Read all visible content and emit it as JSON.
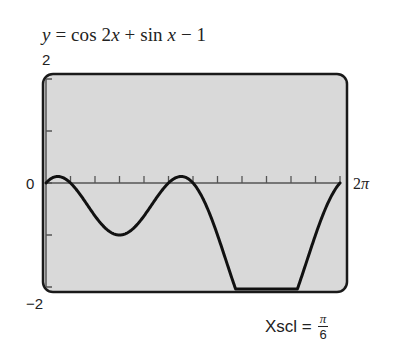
{
  "chart_data": {
    "type": "line",
    "title": "y = cos 2x + sin x − 1",
    "function": "cos(2x) + sin(x) - 1",
    "xlabel": "",
    "ylabel": "",
    "xlim": [
      0,
      6.2832
    ],
    "ylim": [
      -2,
      2
    ],
    "x_tick_step": 0.5236,
    "y_tick_step": 1,
    "x_tick_count": 12,
    "xmin_label": "0",
    "xmax_label": "2π",
    "ymax_label": "2",
    "ymin_label": "−2",
    "annotation": "Xscl = π/6",
    "grid": false,
    "legend": null,
    "series": [
      {
        "name": "y = cos 2x + sin x − 1",
        "x": [
          0,
          0.2618,
          0.5236,
          0.7854,
          1.0472,
          1.309,
          1.5708,
          1.8326,
          2.0944,
          2.3562,
          2.618,
          2.8798,
          3.1416,
          3.4034,
          3.6652,
          3.927,
          4.1888,
          4.4506,
          4.7124,
          4.9742,
          5.236,
          5.4978,
          5.7596,
          6.0214,
          6.2832
        ],
        "values": [
          0,
          0.125,
          0,
          -0.293,
          -0.634,
          -0.9,
          -1,
          -0.9,
          -0.634,
          -0.293,
          0,
          0.125,
          0,
          -0.393,
          -1.0,
          -1.707,
          -2.366,
          -2.832,
          -3,
          -2.832,
          -2.366,
          -1.707,
          -1.0,
          -0.393,
          0
        ]
      }
    ]
  },
  "equation": {
    "lhs": "y",
    "eq": " = cos 2",
    "x1": "x",
    "mid": " + sin ",
    "x2": "x",
    "rhs": " − 1"
  },
  "axes": {
    "ymax": "2",
    "ymin": "−2",
    "zero": "0",
    "xmax_num": "2",
    "xmax_pi": "π"
  },
  "xscl": {
    "label": "Xscl =",
    "numerator": "π",
    "denominator": "6"
  },
  "colors": {
    "screen_fill": "#d9d9d9",
    "frame": "#1a1a1a",
    "axis": "#555555",
    "curve": "#111111"
  }
}
